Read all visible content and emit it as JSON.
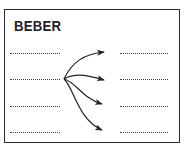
{
  "exercise": {
    "title": "BEBER",
    "left_blanks": [
      "............",
      "............",
      "............",
      "............"
    ],
    "right_blanks": [
      "............",
      "............",
      "............",
      "............"
    ],
    "arrows": {
      "origin_row": 2,
      "target_rows": [
        1,
        2,
        3,
        4
      ]
    },
    "colors": {
      "ink": "#222222",
      "border": "#2a2a2a",
      "background": "#ffffff"
    }
  }
}
